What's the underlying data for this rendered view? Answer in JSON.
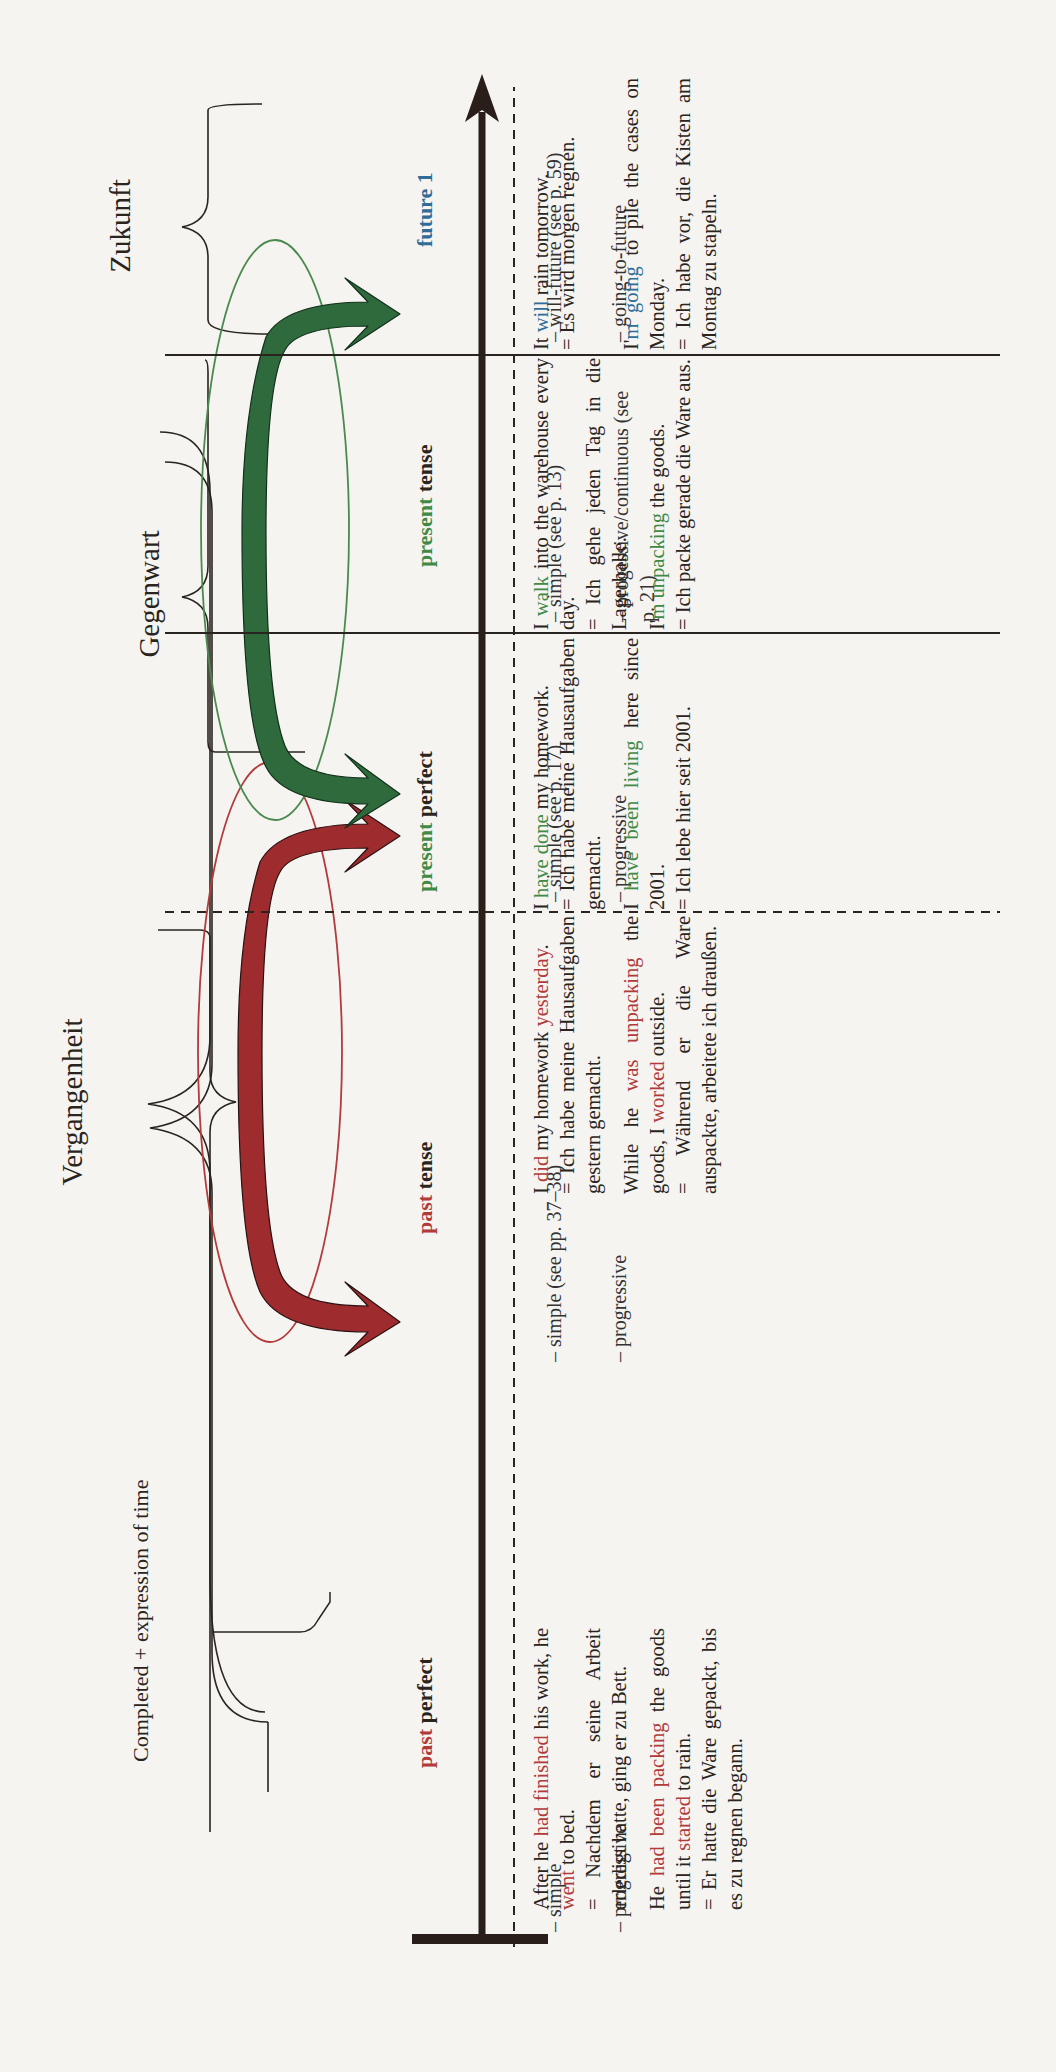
{
  "periods": {
    "past": "Vergangenheit",
    "present": "Gegenwart",
    "future": "Zukunft"
  },
  "bracket_note": "Completed + expression of time",
  "colors": {
    "past": "#9e2b2e",
    "present": "#2f6b3d",
    "future": "#2f6d98",
    "axis": "#2a1e1a"
  },
  "tenses": [
    {
      "id": "past-perfect",
      "label_colored": "past",
      "label_rest": " perfect",
      "color": "past",
      "forms": [
        "– simple",
        "– progressive"
      ],
      "examples": [
        {
          "english": [
            {
              "text": "After he ",
              "c": "k"
            },
            {
              "text": "had finished",
              "c": "red"
            },
            {
              "text": " his work, he ",
              "c": "k"
            },
            {
              "text": "went",
              "c": "red"
            },
            {
              "text": " to bed.",
              "c": "k"
            }
          ],
          "german": "= Nachdem er seine Arbeit erledigt hatte, ging er zu Bett."
        },
        {
          "english": [
            {
              "text": "He ",
              "c": "k"
            },
            {
              "text": "had been packing",
              "c": "red"
            },
            {
              "text": " the goods until it ",
              "c": "k"
            },
            {
              "text": "started",
              "c": "red"
            },
            {
              "text": " to rain.",
              "c": "k"
            }
          ],
          "german": "= Er hatte die Ware gepackt, bis es zu regnen begann."
        }
      ]
    },
    {
      "id": "past-tense",
      "label_colored": "past",
      "label_rest": " tense",
      "color": "past",
      "forms": [
        "– simple (see pp. 37–38)",
        "– progressive"
      ],
      "examples": [
        {
          "english": [
            {
              "text": "I ",
              "c": "k"
            },
            {
              "text": "did",
              "c": "red"
            },
            {
              "text": " my homework ",
              "c": "k"
            },
            {
              "text": "yesterday",
              "c": "red"
            },
            {
              "text": ".",
              "c": "k"
            }
          ],
          "german": "= Ich habe meine Hausaufgaben gestern gemacht."
        },
        {
          "english": [
            {
              "text": "While he ",
              "c": "k"
            },
            {
              "text": "was unpacking",
              "c": "red"
            },
            {
              "text": " the goods, I ",
              "c": "k"
            },
            {
              "text": "worked",
              "c": "red"
            },
            {
              "text": " outside.",
              "c": "k"
            }
          ],
          "german": "= Während er die Ware auspackte, arbeitete ich draußen."
        }
      ]
    },
    {
      "id": "present-perfect",
      "label_colored": "present",
      "label_rest": " perfect",
      "color": "present",
      "forms": [
        "– simple (see p. 17)",
        "– progressive"
      ],
      "examples": [
        {
          "english": [
            {
              "text": "I ",
              "c": "k"
            },
            {
              "text": "have done",
              "c": "green"
            },
            {
              "text": " my homework.",
              "c": "k"
            }
          ],
          "german": "= Ich habe meine Hausaufgaben gemacht."
        },
        {
          "english": [
            {
              "text": "I ",
              "c": "k"
            },
            {
              "text": "have been living",
              "c": "green"
            },
            {
              "text": " here since 2001.",
              "c": "k"
            }
          ],
          "german": "= Ich lebe hier seit 2001."
        }
      ]
    },
    {
      "id": "present-tense",
      "label_colored": "present",
      "label_rest": " tense",
      "color": "present",
      "forms": [
        "– simple (see p. 13)",
        "– progessive/continuous (see p. 21)"
      ],
      "examples": [
        {
          "english": [
            {
              "text": "I ",
              "c": "k"
            },
            {
              "text": "walk",
              "c": "green"
            },
            {
              "text": " into the warehouse every day.",
              "c": "k"
            }
          ],
          "german": "= Ich gehe jeden Tag in die Lagerhalle."
        },
        {
          "english": [
            {
              "text": "I'",
              "c": "k"
            },
            {
              "text": "m unpacking",
              "c": "green"
            },
            {
              "text": " the goods.",
              "c": "k"
            }
          ],
          "german": "= Ich packe gerade die Ware aus."
        }
      ]
    },
    {
      "id": "future-1",
      "label_colored": "future 1",
      "label_rest": "",
      "color": "future",
      "forms": [
        "– will-future (see p. 59)",
        "– going-to-future"
      ],
      "examples": [
        {
          "english": [
            {
              "text": "It ",
              "c": "k"
            },
            {
              "text": "will",
              "c": "blue"
            },
            {
              "text": " rain tomorrow.",
              "c": "k"
            }
          ],
          "german": "= Es wird morgen regnen."
        },
        {
          "english": [
            {
              "text": "I'",
              "c": "k"
            },
            {
              "text": "m going",
              "c": "blue"
            },
            {
              "text": " to pile the cases on Monday.",
              "c": "k"
            }
          ],
          "german": "= Ich habe vor, die Kisten am Montag zu stapeln."
        }
      ]
    }
  ]
}
